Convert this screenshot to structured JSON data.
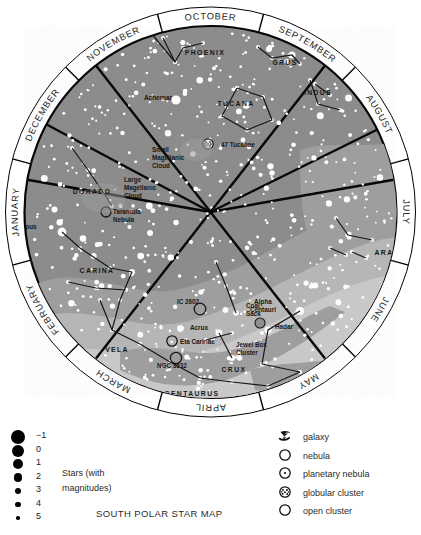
{
  "map": {
    "title": "SOUTH POLAR STAR MAP",
    "months": [
      {
        "name": "JANUARY"
      },
      {
        "name": "FEBRUARY"
      },
      {
        "name": "MARCH"
      },
      {
        "name": "APRIL"
      },
      {
        "name": "MAY"
      },
      {
        "name": "JUNE"
      },
      {
        "name": "JULY"
      },
      {
        "name": "AUGUST"
      },
      {
        "name": "SEPTEMBER"
      },
      {
        "name": "OCTOBER"
      },
      {
        "name": "NOVEMBER"
      },
      {
        "name": "DECEMBER"
      }
    ],
    "constellations": [
      {
        "name": "PHOENIX",
        "x": 205,
        "y": 55
      },
      {
        "name": "GRUS",
        "x": 285,
        "y": 65
      },
      {
        "name": "TUCANA",
        "x": 236,
        "y": 106
      },
      {
        "name": "INDUS",
        "x": 318,
        "y": 95
      },
      {
        "name": "DORADO",
        "x": 92,
        "y": 194
      },
      {
        "name": "CARINA",
        "x": 97,
        "y": 273
      },
      {
        "name": "VELA",
        "x": 117,
        "y": 352
      },
      {
        "name": "ARA",
        "x": 384,
        "y": 255
      },
      {
        "name": "CRUX",
        "x": 234,
        "y": 372
      },
      {
        "name": "CENTAURUS",
        "x": 192,
        "y": 396
      }
    ],
    "stars_labeled": [
      {
        "name": "Achernar",
        "x": 158,
        "y": 100
      },
      {
        "name": "Canopus",
        "x": 23,
        "y": 229
      },
      {
        "name": "Acrux",
        "x": 199,
        "y": 330
      },
      {
        "name": "Alpha Centauri",
        "x": 263,
        "y": 304
      },
      {
        "name": "Hadar",
        "x": 284,
        "y": 329
      }
    ],
    "deep_sky": [
      {
        "name": "47 Tucanae",
        "x": 216,
        "y": 144
      },
      {
        "name": "Small Magellanic Cloud",
        "x": 166,
        "y": 152
      },
      {
        "name": "Large Magellanic Cloud",
        "x": 125,
        "y": 178
      },
      {
        "name": "Tarantula Nebula",
        "x": 137,
        "y": 216
      },
      {
        "name": "IC 2602",
        "x": 183,
        "y": 305
      },
      {
        "name": "Eta Carinae",
        "x": 179,
        "y": 345
      },
      {
        "name": "NGC 3532",
        "x": 166,
        "y": 366
      },
      {
        "name": "Coal Sack",
        "x": 253,
        "y": 312
      },
      {
        "name": "Jewel Box Cluster",
        "x": 237,
        "y": 348
      },
      {
        "name": "Omega Centauri",
        "x": 282,
        "y": 392
      }
    ]
  },
  "legend": {
    "magnitudes": [
      "-1",
      "0",
      "1",
      "2",
      "3",
      "4",
      "5"
    ],
    "stars_label_line1": "Stars (with",
    "stars_label_line2": "magnitudes)",
    "symbols": [
      {
        "icon": "galaxy-icon",
        "label": "galaxy"
      },
      {
        "icon": "nebula-icon",
        "label": "nebula"
      },
      {
        "icon": "planetary-nebula-icon",
        "label": "planetary nebula"
      },
      {
        "icon": "globular-cluster-icon",
        "label": "globular cluster"
      },
      {
        "icon": "open-cluster-icon",
        "label": "open cluster"
      }
    ]
  },
  "colors": {
    "sky_dark": "#8a8a8a",
    "sky_mid": "#9d9d9d",
    "sky_light": "#b6b6b6",
    "sky_lighter": "#c9c9c9",
    "ring": "#ffffff",
    "ink": "#000000",
    "star": "#ffffff"
  }
}
